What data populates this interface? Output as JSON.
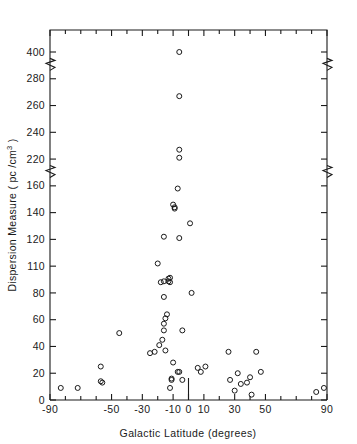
{
  "chart_data": {
    "type": "scatter",
    "title": "",
    "xlabel": "Galactic Latitude (degrees)",
    "ylabel": "Dispersion Measure ( pc / cm3 )",
    "ylabel_parts": {
      "main": "Dispersion Measure ( pc /cm",
      "exponent": "3",
      "tail": " )"
    },
    "xlim": [
      -90,
      90
    ],
    "xticks_major": [
      -90,
      -50,
      -30,
      -10,
      0,
      10,
      30,
      50,
      90
    ],
    "xticks_major_labels": [
      "-90",
      "-50",
      "-30",
      "-10",
      "0",
      "10",
      "30",
      "50",
      "90"
    ],
    "xticks_minor": [
      -80,
      -70,
      -60,
      -40,
      -20,
      20,
      40,
      60,
      70,
      80
    ],
    "yticks_labels": [
      "400",
      "280",
      "260",
      "240",
      "220",
      "160",
      "140",
      "120",
      "110",
      "80",
      "60",
      "40",
      "20",
      "0"
    ],
    "yticks_values": [
      400,
      280,
      260,
      240,
      220,
      160,
      140,
      120,
      110,
      80,
      60,
      40,
      20,
      0
    ],
    "y_axis_breaks": [
      [
        160,
        220
      ],
      [
        280,
        400
      ]
    ],
    "grid": false,
    "legend": null,
    "marker": "open-circle",
    "marker_color": "#1a1a1a",
    "points": [
      {
        "x": -83,
        "y": 9
      },
      {
        "x": -72,
        "y": 9
      },
      {
        "x": -57,
        "y": 25
      },
      {
        "x": -57,
        "y": 14
      },
      {
        "x": -56,
        "y": 13
      },
      {
        "x": -45,
        "y": 50
      },
      {
        "x": -25,
        "y": 35
      },
      {
        "x": -22,
        "y": 36
      },
      {
        "x": -19,
        "y": 41
      },
      {
        "x": -17,
        "y": 45
      },
      {
        "x": -16,
        "y": 52
      },
      {
        "x": -16,
        "y": 57
      },
      {
        "x": -15,
        "y": 61
      },
      {
        "x": -14,
        "y": 64
      },
      {
        "x": -15,
        "y": 37
      },
      {
        "x": -16,
        "y": 77
      },
      {
        "x": -18,
        "y": 92
      },
      {
        "x": -16,
        "y": 93
      },
      {
        "x": -20,
        "y": 111
      },
      {
        "x": -13,
        "y": 96
      },
      {
        "x": -13,
        "y": 93
      },
      {
        "x": -12,
        "y": 92
      },
      {
        "x": -12,
        "y": 97
      },
      {
        "x": -16,
        "y": 122
      },
      {
        "x": -9,
        "y": 144
      },
      {
        "x": -10,
        "y": 146
      },
      {
        "x": -9,
        "y": 143
      },
      {
        "x": -7,
        "y": 158
      },
      {
        "x": -6,
        "y": 221
      },
      {
        "x": -6,
        "y": 227
      },
      {
        "x": -6,
        "y": 267
      },
      {
        "x": -6,
        "y": 403
      },
      {
        "x": -6,
        "y": 121
      },
      {
        "x": -4,
        "y": 52
      },
      {
        "x": -10,
        "y": 28
      },
      {
        "x": -11,
        "y": 16
      },
      {
        "x": -11,
        "y": 15
      },
      {
        "x": -12,
        "y": 9
      },
      {
        "x": -7,
        "y": 21
      },
      {
        "x": -6,
        "y": 21
      },
      {
        "x": -4,
        "y": 15
      },
      {
        "x": 1,
        "y": 132
      },
      {
        "x": 2,
        "y": 80
      },
      {
        "x": 6,
        "y": 24
      },
      {
        "x": 8,
        "y": 21
      },
      {
        "x": 11,
        "y": 25
      },
      {
        "x": 26,
        "y": 36
      },
      {
        "x": 27,
        "y": 15
      },
      {
        "x": 30,
        "y": 7
      },
      {
        "x": 32,
        "y": 20
      },
      {
        "x": 34,
        "y": 12
      },
      {
        "x": 38,
        "y": 13
      },
      {
        "x": 40,
        "y": 17
      },
      {
        "x": 41,
        "y": 4
      },
      {
        "x": 44,
        "y": 36
      },
      {
        "x": 47,
        "y": 21
      },
      {
        "x": 83,
        "y": 6
      },
      {
        "x": 88,
        "y": 9
      }
    ]
  },
  "axis": {
    "x_title": "Galactic Latitude (degrees)",
    "y_title_main": "Dispersion Measure ( pc /cm",
    "y_title_sup": "3",
    "y_title_end": " )"
  }
}
